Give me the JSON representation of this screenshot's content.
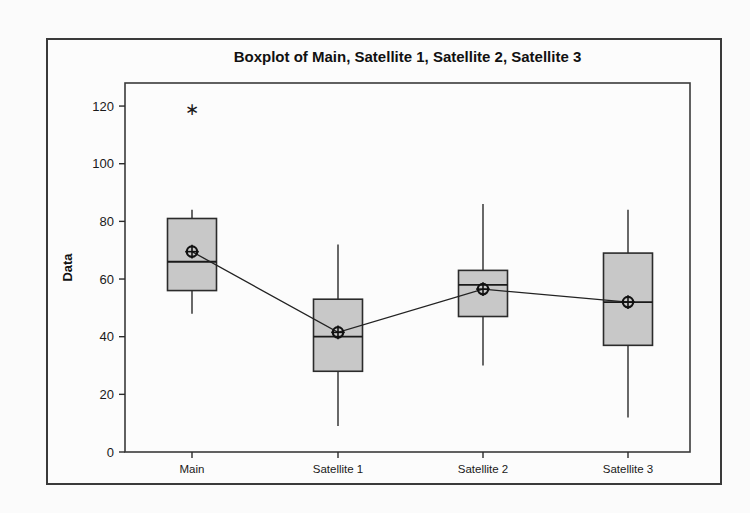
{
  "chart_data": {
    "type": "boxplot",
    "title": "Boxplot of Main, Satellite 1, Satellite 2, Satellite 3",
    "xlabel": "",
    "ylabel": "Data",
    "categories": [
      "Main",
      "Satellite 1",
      "Satellite 2",
      "Satellite 3"
    ],
    "ylim": [
      0,
      128
    ],
    "yticks": [
      0,
      20,
      40,
      60,
      80,
      100,
      120
    ],
    "ytick_labels": [
      "0",
      "20",
      "40",
      "60",
      "80",
      "100",
      "120"
    ],
    "grid": false,
    "legend": "none",
    "mean_connect_line": true,
    "boxes": [
      {
        "category": "Main",
        "whisker_low": 48,
        "q1": 56,
        "median": 66,
        "q3": 81,
        "whisker_high": 84,
        "mean": 69.5,
        "outliers": [
          119
        ]
      },
      {
        "category": "Satellite 1",
        "whisker_low": 9,
        "q1": 28,
        "median": 40,
        "q3": 53,
        "whisker_high": 72,
        "mean": 41.5,
        "outliers": []
      },
      {
        "category": "Satellite 2",
        "whisker_low": 30,
        "q1": 47,
        "median": 58,
        "q3": 63,
        "whisker_high": 86,
        "mean": 56.5,
        "outliers": []
      },
      {
        "category": "Satellite 3",
        "whisker_low": 12,
        "q1": 37,
        "median": 52,
        "q3": 69,
        "whisker_high": 84,
        "mean": 52,
        "outliers": []
      }
    ],
    "colors": {
      "box_fill": "#c8c8c8",
      "box_edge": "#2b2b2b",
      "median_line": "#1a1a1a",
      "whisker": "#1a1a1a",
      "mean_marker": "#111111",
      "mean_line": "#222222",
      "outlier": "#1a1a1a",
      "plot_border": "#3a3a3a",
      "figure_border": "#3a3a3a",
      "background": "#fcfcfc"
    },
    "geometry": {
      "plot_left": 125,
      "plot_right": 690,
      "plot_top": 83,
      "plot_bottom": 452,
      "box_width": 49,
      "category_x": [
        192,
        338,
        483,
        628
      ]
    }
  }
}
